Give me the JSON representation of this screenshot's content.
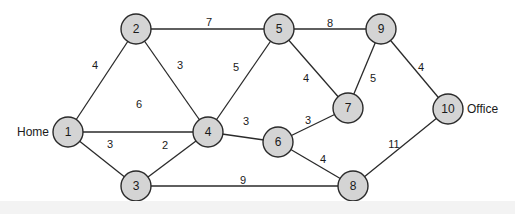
{
  "graph": {
    "title": "",
    "nodes": [
      {
        "id": "1",
        "label": "1",
        "x": 68,
        "y": 132,
        "tag": "Home",
        "tag_side": "left"
      },
      {
        "id": "2",
        "label": "2",
        "x": 136,
        "y": 29
      },
      {
        "id": "3",
        "label": "3",
        "x": 136,
        "y": 186
      },
      {
        "id": "4",
        "label": "4",
        "x": 208,
        "y": 132
      },
      {
        "id": "5",
        "label": "5",
        "x": 279,
        "y": 29
      },
      {
        "id": "6",
        "label": "6",
        "x": 278,
        "y": 142
      },
      {
        "id": "7",
        "label": "7",
        "x": 348,
        "y": 108
      },
      {
        "id": "8",
        "label": "8",
        "x": 353,
        "y": 186
      },
      {
        "id": "9",
        "label": "9",
        "x": 381,
        "y": 29
      },
      {
        "id": "10",
        "label": "10",
        "x": 448,
        "y": 109,
        "tag": "Office",
        "tag_side": "right"
      }
    ],
    "edges": [
      {
        "from": "1",
        "to": "2",
        "weight": "4",
        "lx": 95,
        "ly": 66
      },
      {
        "from": "1",
        "to": "4",
        "weight": "6",
        "lx": 139,
        "ly": 105
      },
      {
        "from": "1",
        "to": "3",
        "weight": "3",
        "lx": 110,
        "ly": 145
      },
      {
        "from": "2",
        "to": "4",
        "weight": "3",
        "lx": 180,
        "ly": 66
      },
      {
        "from": "2",
        "to": "5",
        "weight": "7",
        "lx": 209,
        "ly": 23
      },
      {
        "from": "3",
        "to": "4",
        "weight": "2",
        "lx": 165,
        "ly": 146
      },
      {
        "from": "3",
        "to": "8",
        "weight": "9",
        "lx": 243,
        "ly": 181
      },
      {
        "from": "4",
        "to": "5",
        "weight": "5",
        "lx": 236,
        "ly": 68
      },
      {
        "from": "4",
        "to": "6",
        "weight": "3",
        "lx": 246,
        "ly": 122
      },
      {
        "from": "5",
        "to": "9",
        "weight": "8",
        "lx": 330,
        "ly": 24
      },
      {
        "from": "5",
        "to": "7",
        "weight": "4",
        "lx": 306,
        "ly": 79
      },
      {
        "from": "6",
        "to": "7",
        "weight": "3",
        "lx": 308,
        "ly": 121
      },
      {
        "from": "6",
        "to": "8",
        "weight": "4",
        "lx": 323,
        "ly": 160
      },
      {
        "from": "9",
        "to": "7",
        "weight": "5",
        "lx": 373,
        "ly": 79
      },
      {
        "from": "9",
        "to": "10",
        "weight": "4",
        "lx": 421,
        "ly": 68
      },
      {
        "from": "8",
        "to": "10",
        "weight": "11",
        "lx": 394,
        "ly": 145
      }
    ]
  },
  "colors": {
    "node_fill": "#d4d4d4",
    "stroke": "#2a2a2a",
    "text": "#1a1a1a",
    "background": "#ffffff"
  }
}
